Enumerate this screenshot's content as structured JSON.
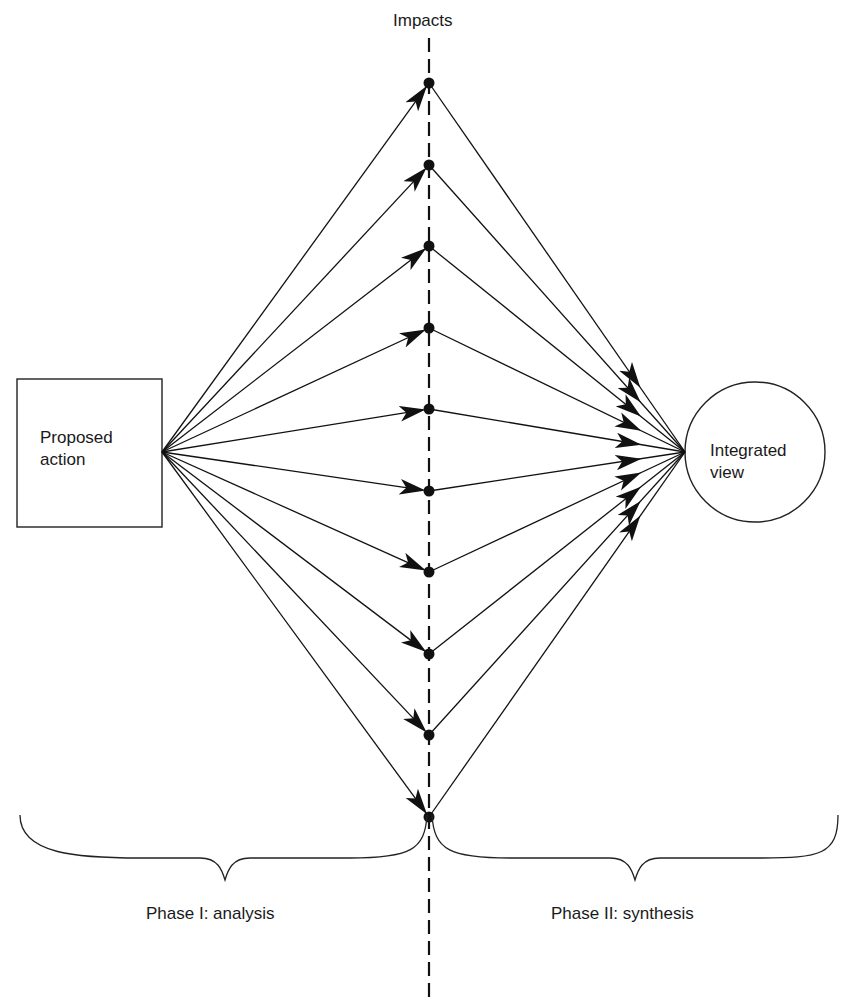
{
  "diagram": {
    "type": "flow-diagram",
    "axis_label": "Impacts",
    "source_node": {
      "label_line1": "Proposed",
      "label_line2": "action",
      "shape": "rectangle"
    },
    "target_node": {
      "label_line1": "Integrated",
      "label_line2": "view",
      "shape": "circle"
    },
    "impact_count": 10,
    "impact_y": [
      83,
      165,
      246,
      328,
      409,
      491,
      572,
      654,
      735,
      817
    ],
    "phases": [
      {
        "label": "Phase I: analysis"
      },
      {
        "label": "Phase II: synthesis"
      }
    ],
    "colors": {
      "line": "#111111",
      "background": "#ffffff"
    }
  }
}
